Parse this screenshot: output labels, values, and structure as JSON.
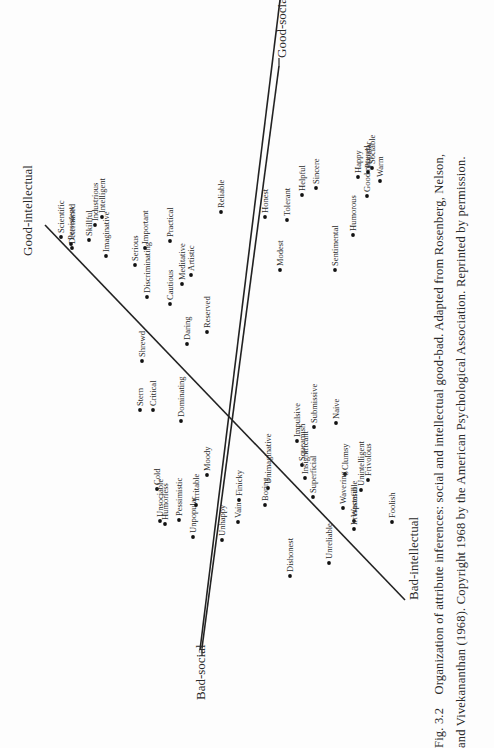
{
  "figure": {
    "number": "Fig. 3.2",
    "caption": "Organization of attribute inferences: social and intellectual good-bad. Adapted from Rosenberg, Nelson, and Vivekananthan (1968). Copyright 1968 by the American Psychological Association. Reprinted by permission.",
    "axes": {
      "good_intellectual": "Good-intellectual",
      "bad_intellectual": "Bad-intellectual",
      "good_social": "Good-social",
      "bad_social": "Bad-social"
    },
    "terms": [
      {
        "label": "Scientific",
        "x": 61,
        "y": 237
      },
      {
        "label": "Persistent",
        "x": 71,
        "y": 244
      },
      {
        "label": "Determined",
        "x": 72,
        "y": 248
      },
      {
        "label": "Skillful",
        "x": 89,
        "y": 240
      },
      {
        "label": "Industrious",
        "x": 95,
        "y": 225
      },
      {
        "label": "Intelligent",
        "x": 102,
        "y": 217
      },
      {
        "label": "Imaginative",
        "x": 106,
        "y": 256
      },
      {
        "label": "Serious",
        "x": 135,
        "y": 265
      },
      {
        "label": "Important",
        "x": 145,
        "y": 248
      },
      {
        "label": "Practical",
        "x": 170,
        "y": 241
      },
      {
        "label": "Discriminating",
        "x": 147,
        "y": 297
      },
      {
        "label": "Cautious",
        "x": 170,
        "y": 304
      },
      {
        "label": "Meditative",
        "x": 182,
        "y": 284
      },
      {
        "label": "Artistic",
        "x": 191,
        "y": 275
      },
      {
        "label": "Reliable",
        "x": 221,
        "y": 212
      },
      {
        "label": "Reserved",
        "x": 207,
        "y": 332
      },
      {
        "label": "Shrewd",
        "x": 142,
        "y": 361
      },
      {
        "label": "Daring",
        "x": 187,
        "y": 344
      },
      {
        "label": "Honest",
        "x": 265,
        "y": 217
      },
      {
        "label": "Tolerant",
        "x": 287,
        "y": 220
      },
      {
        "label": "Helpful",
        "x": 302,
        "y": 195
      },
      {
        "label": "Sincere",
        "x": 316,
        "y": 188
      },
      {
        "label": "Modest",
        "x": 280,
        "y": 270
      },
      {
        "label": "Sentimental",
        "x": 335,
        "y": 270
      },
      {
        "label": "Humorous",
        "x": 353,
        "y": 235
      },
      {
        "label": "Good natured",
        "x": 367,
        "y": 196
      },
      {
        "label": "Happy",
        "x": 358,
        "y": 177
      },
      {
        "label": "Popular",
        "x": 368,
        "y": 172
      },
      {
        "label": "Sociable",
        "x": 372,
        "y": 168
      },
      {
        "label": "Warm",
        "x": 380,
        "y": 181
      },
      {
        "label": "Stern",
        "x": 140,
        "y": 410
      },
      {
        "label": "Critical",
        "x": 153,
        "y": 410
      },
      {
        "label": "Dominating",
        "x": 181,
        "y": 421
      },
      {
        "label": "Cold",
        "x": 157,
        "y": 489
      },
      {
        "label": "Unsociable",
        "x": 160,
        "y": 521
      },
      {
        "label": "Humorless",
        "x": 165,
        "y": 524
      },
      {
        "label": "Pessimistic",
        "x": 179,
        "y": 520
      },
      {
        "label": "Unpopular",
        "x": 193,
        "y": 537
      },
      {
        "label": "Irritable",
        "x": 196,
        "y": 505
      },
      {
        "label": "Moody",
        "x": 207,
        "y": 475
      },
      {
        "label": "Unhappy",
        "x": 222,
        "y": 540
      },
      {
        "label": "Vain",
        "x": 238,
        "y": 522
      },
      {
        "label": "Finicky",
        "x": 239,
        "y": 500
      },
      {
        "label": "Unimaginative",
        "x": 268,
        "y": 488
      },
      {
        "label": "Boring",
        "x": 265,
        "y": 505
      },
      {
        "label": "Impulsive",
        "x": 297,
        "y": 441
      },
      {
        "label": "Squeamish",
        "x": 302,
        "y": 465
      },
      {
        "label": "Insignificant",
        "x": 305,
        "y": 478
      },
      {
        "label": "Superficial",
        "x": 313,
        "y": 497
      },
      {
        "label": "Submissive",
        "x": 314,
        "y": 427
      },
      {
        "label": "Naive",
        "x": 336,
        "y": 423
      },
      {
        "label": "Clumsy",
        "x": 345,
        "y": 474
      },
      {
        "label": "Unintelligent",
        "x": 361,
        "y": 490
      },
      {
        "label": "Frivolous",
        "x": 368,
        "y": 480
      },
      {
        "label": "Wavering",
        "x": 343,
        "y": 508
      },
      {
        "label": "Wasteful",
        "x": 354,
        "y": 521
      },
      {
        "label": "Unreliable",
        "x": 329,
        "y": 563
      },
      {
        "label": "Irresponsible",
        "x": 354,
        "y": 529
      },
      {
        "label": "Foolish",
        "x": 392,
        "y": 522
      },
      {
        "label": "Dishonest",
        "x": 290,
        "y": 576
      }
    ]
  }
}
